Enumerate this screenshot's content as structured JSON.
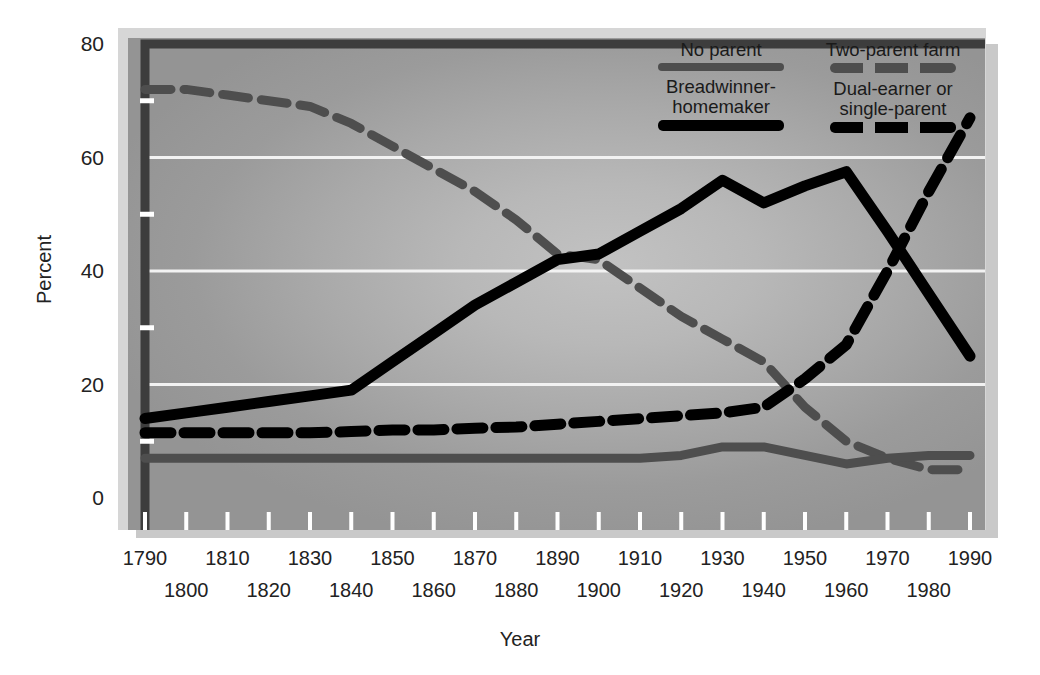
{
  "axes": {
    "ylabel": "Percent",
    "xlabel": "Year",
    "y_ticks": [
      "0",
      "20",
      "40",
      "60",
      "80"
    ],
    "y_minor_ticks": [
      "10",
      "30",
      "50",
      "70"
    ],
    "x_ticks": [
      "1790",
      "1800",
      "1810",
      "1820",
      "1830",
      "1840",
      "1850",
      "1860",
      "1870",
      "1880",
      "1890",
      "1900",
      "1910",
      "1920",
      "1930",
      "1940",
      "1950",
      "1960",
      "1970",
      "1980",
      "1990"
    ]
  },
  "legend": {
    "entries": [
      {
        "label": "No parent",
        "style": "solid",
        "color": "#4e4e4e",
        "swatch": "sw-solid-gray"
      },
      {
        "label": "Two-parent farm",
        "style": "dashed",
        "color": "#4e4e4e",
        "swatch": "sw-dash-gray"
      },
      {
        "label": "Breadwinner-\nhomemaker",
        "style": "solid",
        "color": "#000000",
        "swatch": "sw-solid-black"
      },
      {
        "label": "Dual-earner or\nsingle-parent",
        "style": "dashed",
        "color": "#000000",
        "swatch": "sw-dash-black"
      }
    ]
  },
  "colors": {
    "gray_series": "#4e4e4e",
    "black_series": "#000000",
    "gridline": "#f2f2f2",
    "plot_background": "#adadad",
    "mat": "#d6d6d6",
    "shadow": "#c9c9c9"
  },
  "chart_data": {
    "type": "line",
    "title": "",
    "xlabel": "Year",
    "ylabel": "Percent",
    "xlim": [
      1790,
      1990
    ],
    "ylim": [
      0,
      80
    ],
    "grid": "horizontal",
    "legend_position": "top-right",
    "x": [
      1790,
      1800,
      1810,
      1820,
      1830,
      1840,
      1850,
      1860,
      1870,
      1880,
      1890,
      1900,
      1910,
      1920,
      1930,
      1940,
      1950,
      1960,
      1970,
      1980,
      1990
    ],
    "series": [
      {
        "name": "Two-parent farm",
        "style": "dashed",
        "color": "#4e4e4e",
        "values": [
          72,
          72,
          71,
          70,
          69,
          66,
          62,
          58,
          54,
          49,
          43,
          42,
          37,
          32,
          28,
          24,
          16,
          10,
          7,
          5,
          5
        ]
      },
      {
        "name": "Breadwinner-homemaker",
        "style": "solid",
        "color": "#000000",
        "values": [
          14,
          15,
          16,
          17,
          18,
          19,
          24,
          29,
          34,
          38,
          42,
          43,
          47,
          51,
          56,
          52,
          55,
          57.5,
          47,
          36,
          25
        ]
      },
      {
        "name": "Dual-earner or single-parent",
        "style": "dashed",
        "color": "#000000",
        "values": [
          11.5,
          11.5,
          11.5,
          11.5,
          11.5,
          11.7,
          12,
          12,
          12.3,
          12.5,
          13,
          13.5,
          14,
          14.5,
          15,
          16,
          21,
          27,
          40,
          54,
          67
        ]
      },
      {
        "name": "No parent",
        "style": "solid",
        "color": "#4e4e4e",
        "values": [
          7,
          7,
          7,
          7,
          7,
          7,
          7,
          7,
          7,
          7,
          7,
          7,
          7,
          7.5,
          9,
          9,
          7.5,
          6,
          7,
          7.5,
          7.5
        ]
      }
    ]
  }
}
